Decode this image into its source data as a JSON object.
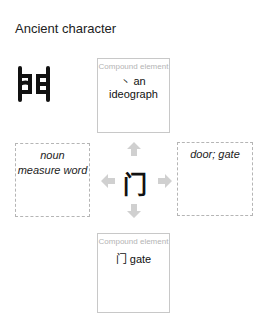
{
  "header": {
    "title": "Ancient character"
  },
  "center": {
    "character": "门"
  },
  "top_box": {
    "caption": "Compound element",
    "glyph": "丶",
    "value": "an ideograph"
  },
  "bottom_box": {
    "caption": "Compound element",
    "glyph": "门",
    "value": "gate"
  },
  "left_box": {
    "lines": [
      "noun",
      "measure word"
    ]
  },
  "right_box": {
    "lines": [
      "door; gate"
    ]
  },
  "colors": {
    "arrow": "#d0d0d0",
    "solid_border": "#c8c8c8",
    "dashed_border": "#b5b5b5",
    "caption": "#b4b4b4"
  }
}
